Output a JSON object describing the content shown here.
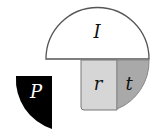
{
  "diagram": {
    "pieces": [
      {
        "id": "I",
        "label": "I",
        "shape": "semicircle",
        "fill": "#ffffff",
        "stroke": "#555555",
        "label_color": "#111111"
      },
      {
        "id": "r",
        "label": "r",
        "shape": "rectangle",
        "fill": "#d6d6d6",
        "stroke": "#777777",
        "label_color": "#111111"
      },
      {
        "id": "t",
        "label": "t",
        "shape": "quarter-sector",
        "fill": "#a9a9a9",
        "stroke": "#777777",
        "label_color": "#111111"
      },
      {
        "id": "P",
        "label": "P",
        "shape": "quarter-sector",
        "fill": "#000000",
        "stroke": "#000000",
        "label_color": "#ffffff"
      }
    ]
  }
}
